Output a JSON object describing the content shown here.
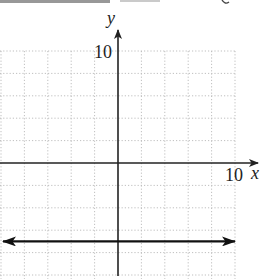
{
  "header_fragment": "",
  "chart_data": {
    "type": "line",
    "title": "",
    "xlabel": "x",
    "ylabel": "y",
    "x_tick_label": "10",
    "y_tick_label": "10",
    "xlim": [
      -10,
      10
    ],
    "ylim": [
      -10,
      10
    ],
    "grid": true,
    "grid_step": 2,
    "grid_style": "dotted",
    "legend": null,
    "series": [
      {
        "name": "horizontal line",
        "equation": "y = -7",
        "x": [
          -10,
          10
        ],
        "y": [
          -7,
          -7
        ],
        "arrows_both_ends": true
      }
    ]
  },
  "colors": {
    "axis": "#222222",
    "grid": "#b8b8b8",
    "line": "#111111"
  }
}
